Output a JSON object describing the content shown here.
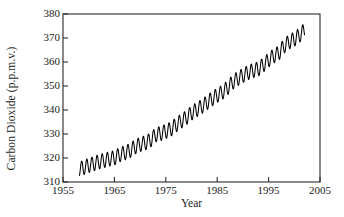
{
  "chart_data": {
    "type": "line",
    "title": "",
    "xlabel": "Year",
    "ylabel": "Carbon Dioxide (p.p.m.v.)",
    "xlim": [
      1955,
      2005
    ],
    "ylim": [
      310,
      380
    ],
    "xticks": [
      1955,
      1965,
      1975,
      1985,
      1995,
      2005
    ],
    "yticks": [
      310,
      320,
      330,
      340,
      350,
      360,
      370,
      380
    ],
    "grid": false,
    "legend": null,
    "series": [
      {
        "name": "Atmospheric CO2 (Mauna Loa)",
        "color": "#000000",
        "description": "Monthly mean atmospheric carbon dioxide concentration showing a rising long-term trend with an annual seasonal oscillation of about 6 p.p.m.v. peak-to-trough.",
        "x_start": 1958.2,
        "x_end": 2002.0,
        "seasonal_amplitude": 3.0,
        "annual_means": [
          {
            "year": 1958,
            "value": 315.3
          },
          {
            "year": 1959,
            "value": 315.98
          },
          {
            "year": 1960,
            "value": 316.91
          },
          {
            "year": 1961,
            "value": 317.64
          },
          {
            "year": 1962,
            "value": 318.45
          },
          {
            "year": 1963,
            "value": 318.99
          },
          {
            "year": 1964,
            "value": 319.62
          },
          {
            "year": 1965,
            "value": 320.04
          },
          {
            "year": 1966,
            "value": 321.38
          },
          {
            "year": 1967,
            "value": 322.16
          },
          {
            "year": 1968,
            "value": 323.04
          },
          {
            "year": 1969,
            "value": 324.62
          },
          {
            "year": 1970,
            "value": 325.68
          },
          {
            "year": 1971,
            "value": 326.32
          },
          {
            "year": 1972,
            "value": 327.45
          },
          {
            "year": 1973,
            "value": 329.68
          },
          {
            "year": 1974,
            "value": 330.18
          },
          {
            "year": 1975,
            "value": 331.11
          },
          {
            "year": 1976,
            "value": 332.04
          },
          {
            "year": 1977,
            "value": 333.83
          },
          {
            "year": 1978,
            "value": 335.4
          },
          {
            "year": 1979,
            "value": 336.84
          },
          {
            "year": 1980,
            "value": 338.75
          },
          {
            "year": 1981,
            "value": 340.11
          },
          {
            "year": 1982,
            "value": 341.45
          },
          {
            "year": 1983,
            "value": 343.05
          },
          {
            "year": 1984,
            "value": 344.65
          },
          {
            "year": 1985,
            "value": 346.12
          },
          {
            "year": 1986,
            "value": 347.42
          },
          {
            "year": 1987,
            "value": 349.19
          },
          {
            "year": 1988,
            "value": 351.57
          },
          {
            "year": 1989,
            "value": 353.12
          },
          {
            "year": 1990,
            "value": 354.39
          },
          {
            "year": 1991,
            "value": 355.61
          },
          {
            "year": 1992,
            "value": 356.45
          },
          {
            "year": 1993,
            "value": 357.1
          },
          {
            "year": 1994,
            "value": 358.83
          },
          {
            "year": 1995,
            "value": 360.82
          },
          {
            "year": 1996,
            "value": 362.61
          },
          {
            "year": 1997,
            "value": 363.73
          },
          {
            "year": 1998,
            "value": 366.7
          },
          {
            "year": 1999,
            "value": 368.38
          },
          {
            "year": 2000,
            "value": 369.55
          },
          {
            "year": 2001,
            "value": 371.14
          },
          {
            "year": 2002,
            "value": 373.28
          }
        ]
      }
    ]
  },
  "axes": {
    "y_title": "Carbon Dioxide (p.p.m.v.)",
    "x_title": "Year",
    "y_labels": [
      "380",
      "370",
      "360",
      "350",
      "340",
      "330",
      "320",
      "310"
    ],
    "x_labels": [
      "1955",
      "1965",
      "1975",
      "1985",
      "1995",
      "2005"
    ]
  },
  "colors": {
    "line": "#000000",
    "frame": "#2a2a2a",
    "background": "#ffffff",
    "text": "#1a1a1a"
  }
}
